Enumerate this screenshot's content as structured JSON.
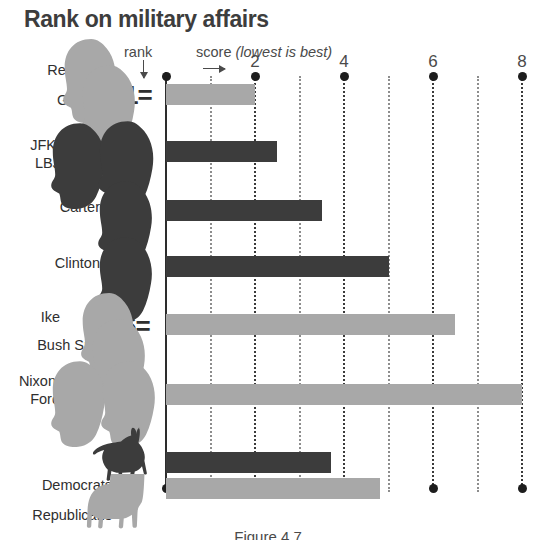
{
  "chart_data": {
    "type": "bar",
    "orientation": "horizontal",
    "title": "Rank on military affairs",
    "xlabel": "score (lowest is best)",
    "ylabel": "",
    "xlim": [
      0,
      8.8
    ],
    "grid": true,
    "legend": "none",
    "note_rank": "rank",
    "note_score_prefix": "score ",
    "note_score_italic": "(lowest is best)",
    "xticks": [
      2,
      4,
      6,
      8
    ],
    "xtick_labels": [
      "2",
      "4",
      "6",
      "8"
    ],
    "minor_xticks": [
      1,
      3,
      5,
      7
    ],
    "categories": [
      "Reagan / GW",
      "JFK/ LBJ",
      "Carter",
      "Clinton",
      "Ike / Bush Sr.",
      "Nixon/ Ford",
      "Democrats",
      "Republicans"
    ],
    "values": [
      2.0,
      2.5,
      3.5,
      5.0,
      6.5,
      8.0,
      3.7,
      4.8
    ],
    "ranks": [
      "1=",
      "3",
      "4",
      "5",
      "6=",
      "8",
      "",
      ""
    ],
    "colors": [
      "#a8a8a8",
      "#3c3c3c",
      "#3c3c3c",
      "#3c3c3c",
      "#a8a8a8",
      "#a8a8a8",
      "#3c3c3c",
      "#a8a8a8"
    ]
  },
  "rows": [
    {
      "label_a": "Reagan",
      "label_b": "GW",
      "rank": "1=",
      "value": 2.0,
      "tone": "light",
      "icon": "two-head-silhouettes-light"
    },
    {
      "label_a": "JFK/",
      "label_b": "LBJ",
      "rank": "3",
      "value": 2.5,
      "tone": "dark",
      "icon": "two-head-silhouettes-dark"
    },
    {
      "label_a": "Carter",
      "label_b": "",
      "rank": "4",
      "value": 3.5,
      "tone": "dark",
      "icon": "one-head-silhouette-dark"
    },
    {
      "label_a": "Clinton",
      "label_b": "",
      "rank": "5",
      "value": 5.0,
      "tone": "dark",
      "icon": "one-head-silhouette-dark"
    },
    {
      "label_a": "Ike",
      "label_b": "Bush Sr.",
      "rank": "6=",
      "value": 6.5,
      "tone": "light",
      "icon": "two-head-silhouettes-light"
    },
    {
      "label_a": "Nixon/",
      "label_b": "Ford",
      "rank": "8",
      "value": 8.0,
      "tone": "light",
      "icon": "two-head-silhouettes-light"
    },
    {
      "label_a": "Democrats",
      "label_b": "",
      "rank": "",
      "value": 3.7,
      "tone": "dark",
      "icon": "donkey-icon"
    },
    {
      "label_a": "Republicans",
      "label_b": "",
      "rank": "",
      "value": 4.8,
      "tone": "light",
      "icon": "elephant-icon"
    }
  ],
  "caption": "Figure 4.7"
}
